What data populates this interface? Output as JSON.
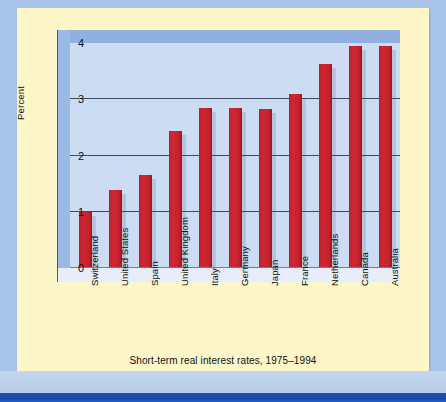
{
  "figure": {
    "caption": "Short-term real interest rates, 1975–1994",
    "colors": {
      "bar": "#c8222f",
      "plot_background": "#ccdcf2",
      "wall_top": "#8fb0e0",
      "wall_left": "#9ab9e4",
      "floor": "#e7eef9",
      "card_background": "#fdf6c8",
      "page_background": "#a8c4e8",
      "bottom_strip": "#1c52b8",
      "gridline": "#3c4a63",
      "text": "#111111"
    }
  },
  "chart_data": {
    "type": "bar",
    "title": "",
    "subtitle": "",
    "xlabel": "",
    "ylabel": "Percent",
    "ylim": [
      0,
      4
    ],
    "yticks": [
      "0",
      "1",
      "2",
      "3",
      "4"
    ],
    "grid": true,
    "legend": false,
    "categories": [
      "Switzerland",
      "United States",
      "Spain",
      "United Kingdom",
      "Italy",
      "Germany",
      "Japan",
      "France",
      "Netherlands",
      "Canada",
      "Australia"
    ],
    "values": [
      1.0,
      1.38,
      1.65,
      2.44,
      2.84,
      2.85,
      2.82,
      3.1,
      3.63,
      3.95,
      3.95
    ],
    "units": "percent"
  }
}
